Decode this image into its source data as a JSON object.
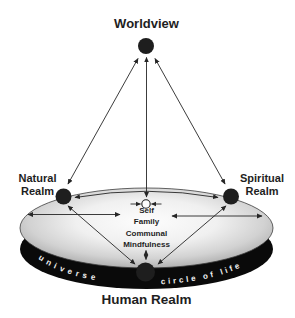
{
  "nodes": {
    "worldview": {
      "label": "Worldview"
    },
    "natural": {
      "line1": "Natural",
      "line2": "Realm"
    },
    "spiritual": {
      "line1": "Spiritual",
      "line2": "Realm"
    },
    "human": {
      "label": "Human Realm"
    }
  },
  "disk": {
    "center_values": [
      "Self",
      "Family",
      "Communal",
      "Mindfulness"
    ],
    "rim_left": "universe",
    "rim_right": "circle of life"
  },
  "colors": {
    "ink": "#1e1e1e",
    "arrow": "#262626",
    "rim": "#0a0a0a",
    "rim_text": "#f2f2f2",
    "surface_center": "#fcfcfc",
    "surface_edge": "#a2a2a2",
    "background": "#ffffff"
  }
}
